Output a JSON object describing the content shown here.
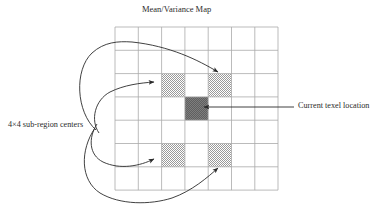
{
  "figure": {
    "title": "Mean/Variance Map",
    "width": 382,
    "height": 211,
    "background": "#ffffff"
  },
  "labels": {
    "left": "4×4 sub-region centers",
    "right": "Current texel location"
  },
  "grid": {
    "columns": 7,
    "rows": 7,
    "x": 115,
    "y": 27,
    "cell_size": 23.3,
    "line_color": "#a9a9a9",
    "line_width": 0.8
  },
  "cells": [
    {
      "name": "sub-region-center-top-left",
      "col": 2,
      "row": 2,
      "fill": "checker-light"
    },
    {
      "name": "sub-region-center-top-right",
      "col": 4,
      "row": 2,
      "fill": "checker-light"
    },
    {
      "name": "current-texel",
      "col": 3,
      "row": 3,
      "fill": "checker-dark"
    },
    {
      "name": "sub-region-center-bottom-left",
      "col": 2,
      "row": 5,
      "fill": "checker-light"
    },
    {
      "name": "sub-region-center-bottom-right",
      "col": 4,
      "row": 5,
      "fill": "checker-light"
    }
  ],
  "colors": {
    "checker_light": "#9a9a9a",
    "checker_dark": "#666666",
    "grid_line": "#a9a9a9",
    "stroke": "#2b2b2b",
    "text": "#2b2b2b"
  },
  "annotations": [
    {
      "name": "leader-to-top-right-cell",
      "target_cell": "sub-region-center-top-right"
    },
    {
      "name": "leader-to-top-left-cell",
      "target_cell": "sub-region-center-top-left"
    },
    {
      "name": "leader-to-bottom-left-cell",
      "target_cell": "sub-region-center-bottom-left"
    },
    {
      "name": "leader-to-bottom-right-cell",
      "target_cell": "sub-region-center-bottom-right"
    },
    {
      "name": "leader-to-current-texel",
      "target_cell": "current-texel"
    }
  ]
}
